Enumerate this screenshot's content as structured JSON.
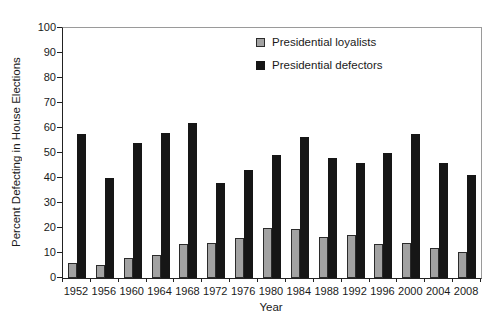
{
  "chart_data": {
    "type": "bar",
    "title": "",
    "xlabel": "Year",
    "ylabel": "Percent Defecting in House Elections",
    "ylim": [
      0,
      100
    ],
    "ytick_step": 10,
    "grid": false,
    "legend_position": "inside-top-center",
    "categories": [
      "1952",
      "1956",
      "1960",
      "1964",
      "1968",
      "1972",
      "1976",
      "1980",
      "1984",
      "1988",
      "1992",
      "1996",
      "2000",
      "2004",
      "2008"
    ],
    "series": [
      {
        "name": "Presidential loyalists",
        "color": "#a2a2a2",
        "border_color": "#2b2b2b",
        "values": [
          6,
          5,
          8,
          9,
          13.5,
          14,
          16,
          20,
          19.5,
          16.5,
          17,
          13.5,
          14,
          12,
          10.5
        ]
      },
      {
        "name": "Presidential defectors",
        "color": "#161616",
        "border_color": "#161616",
        "values": [
          57.5,
          40,
          54,
          58,
          62,
          38,
          43,
          49,
          56.5,
          48,
          46,
          50,
          57.5,
          46,
          41
        ]
      }
    ]
  }
}
